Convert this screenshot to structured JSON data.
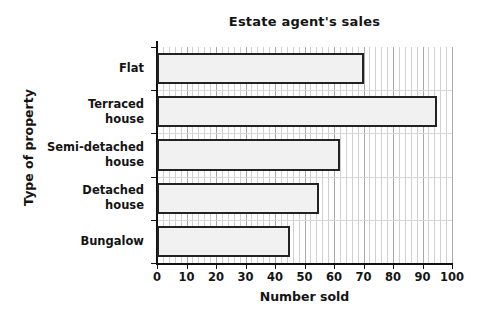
{
  "chart_data": {
    "type": "bar",
    "orientation": "horizontal",
    "title": "Estate agent's sales",
    "xlabel": "Number sold",
    "ylabel": "Type of property",
    "categories": [
      "Flat",
      "Terraced\nhouse",
      "Semi-detached\nhouse",
      "Detached\nhouse",
      "Bungalow"
    ],
    "values": [
      70,
      95,
      62,
      55,
      45
    ],
    "xlim": [
      0,
      100
    ],
    "xticks": [
      0,
      10,
      20,
      30,
      40,
      50,
      60,
      70,
      80,
      90,
      100
    ],
    "xtick_labels": [
      "0",
      "10",
      "20",
      "30",
      "40",
      "50",
      "60",
      "70",
      "80",
      "90",
      "100"
    ],
    "minor_tick_step": 2,
    "grid": true,
    "legend": false,
    "bar_fill_color": "#f1f1f1",
    "bar_edge_color": "#222222",
    "grid_major_color": "#a8a8a8",
    "grid_minor_color": "#d0d0d0",
    "axis_color": "#111111",
    "background_color": "#ffffff"
  }
}
